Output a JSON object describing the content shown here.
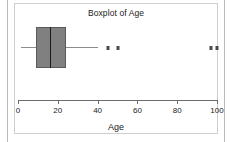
{
  "chart_data": {
    "type": "boxplot",
    "title": "Boxplot of Age",
    "xlabel": "Age",
    "ylabel": "",
    "orientation": "horizontal",
    "xlim": [
      0,
      100
    ],
    "grid": false,
    "legend": null,
    "xticks": [
      {
        "value": 0,
        "label": "0"
      },
      {
        "value": 20,
        "label": "20"
      },
      {
        "value": 40,
        "label": "40"
      },
      {
        "value": 60,
        "label": "60"
      },
      {
        "value": 80,
        "label": "80"
      },
      {
        "value": 100,
        "label": "100"
      }
    ],
    "series": [
      {
        "name": "Age",
        "whisker_low": 1.5,
        "q1": 9,
        "median": 16,
        "q3": 24,
        "whisker_high": 40,
        "outliers": [
          45,
          50,
          97,
          100
        ]
      }
    ],
    "colors": {
      "box_fill": "#808080",
      "box_edge": "#5a5a5a",
      "median": "#1a1a1a",
      "whisker": "#8c8c8c",
      "outlier": "#4a4a4a",
      "axis": "#6b6b6b",
      "text": "#1a1a1a",
      "background": "#ffffff",
      "plot_border": "#cfcfcf"
    }
  }
}
